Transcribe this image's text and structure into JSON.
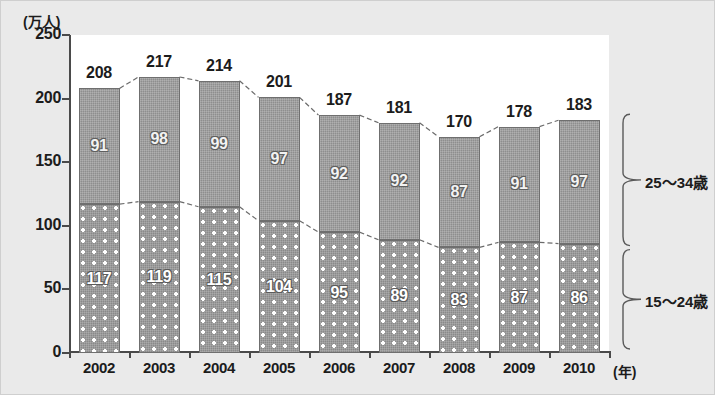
{
  "chart_data": {
    "type": "bar",
    "stacked": true,
    "title": "",
    "xlabel": "(年)",
    "ylabel": "(万人)",
    "ylim": [
      0,
      250
    ],
    "yticks": [
      0,
      50,
      100,
      150,
      200,
      250
    ],
    "grid": false,
    "legend_position": "right-brackets",
    "categories": [
      "2002",
      "2003",
      "2004",
      "2005",
      "2006",
      "2007",
      "2008",
      "2009",
      "2010"
    ],
    "series": [
      {
        "name": "15～24歳",
        "values": [
          117,
          119,
          115,
          104,
          95,
          89,
          83,
          87,
          86
        ]
      },
      {
        "name": "25～34歳",
        "values": [
          91,
          98,
          99,
          97,
          92,
          92,
          87,
          91,
          97
        ]
      }
    ],
    "totals": [
      208,
      217,
      214,
      201,
      187,
      181,
      170,
      178,
      183
    ],
    "annotations": {
      "total_labels_shown": true,
      "segment_labels_shown": true,
      "connector_lines": "dashed lines joining bar tops and joining segment boundaries"
    }
  },
  "axis": {
    "y_unit": "(万人)",
    "x_unit": "(年)",
    "y_tick_labels": [
      "250",
      "200",
      "150",
      "100",
      "50",
      "0"
    ]
  },
  "legend": {
    "upper_label": "25～34歳",
    "lower_label": "15～24歳"
  },
  "colors": {
    "upper_segment": "#8e8e8e",
    "lower_segment": "#8a8a8a",
    "plot_background": "#ffffff",
    "page_background": "#eaeaea",
    "axis": "#4a4a4a",
    "text": "#1c1c1c"
  }
}
